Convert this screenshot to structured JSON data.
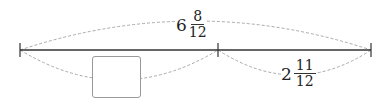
{
  "diagram": {
    "type": "number-line-bar-model",
    "total": {
      "whole": "6",
      "numerator": "8",
      "denominator": "12"
    },
    "known_part": {
      "whole": "2",
      "numerator": "11",
      "denominator": "12"
    },
    "unknown_part": {
      "placeholder": ""
    },
    "colors": {
      "line": "#333333",
      "dashed_arc": "#aaaaaa",
      "box_border": "#999999"
    }
  }
}
